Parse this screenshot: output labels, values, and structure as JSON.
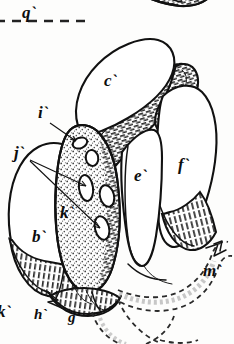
{
  "figure": {
    "background_color": "#fdfdfc",
    "ink_color": "#111111",
    "width": 234,
    "height": 344
  },
  "top_rule": {
    "label": "q`",
    "style": "dashed",
    "description": "horizontal dashed section line at top left"
  },
  "labels": [
    {
      "id": "q",
      "text": "q`",
      "x": 22,
      "y": 18,
      "has_leader": false,
      "note": "top-left section marker beside dashed rule"
    },
    {
      "id": "c",
      "text": "c`",
      "x": 110,
      "y": 85,
      "has_leader": false,
      "note": "upper lobe"
    },
    {
      "id": "i",
      "text": "i`",
      "x": 42,
      "y": 117,
      "has_leader": true,
      "note": "small upper pore"
    },
    {
      "id": "j",
      "text": "j`",
      "x": 16,
      "y": 155,
      "has_leader": true,
      "note": "two leaders to oval pores"
    },
    {
      "id": "e",
      "text": "e`",
      "x": 138,
      "y": 179,
      "has_leader": false,
      "note": "middle wedge lobe"
    },
    {
      "id": "f",
      "text": "f`",
      "x": 182,
      "y": 168,
      "has_leader": false,
      "note": "right lobe"
    },
    {
      "id": "k",
      "text": "k`",
      "x": 63,
      "y": 216,
      "has_leader": false,
      "note": "stippled column"
    },
    {
      "id": "b",
      "text": "b`",
      "x": 36,
      "y": 240,
      "has_leader": false,
      "note": "left lobe"
    },
    {
      "id": "m",
      "text": "m`",
      "x": 207,
      "y": 274,
      "has_leader": false,
      "note": "right dashed tube"
    },
    {
      "id": "kk",
      "text": "k`",
      "x": 2,
      "y": 315,
      "has_leader": false,
      "note": "lower-left marker, partly cropped"
    },
    {
      "id": "h",
      "text": "h`",
      "x": 38,
      "y": 317,
      "has_leader": false,
      "note": "lower base structure"
    },
    {
      "id": "g",
      "text": "g`",
      "x": 72,
      "y": 320,
      "has_leader": false,
      "note": "lower base structure"
    }
  ],
  "regions": [
    {
      "name": "upper-lobe-c",
      "label": "c`",
      "fill": "plain",
      "description": "large rounded lobe at upper centre"
    },
    {
      "name": "left-lobe-b",
      "label": "b`",
      "fill": "plain",
      "description": "large rounded lobe at left with hatched basal band"
    },
    {
      "name": "middle-wedge-e",
      "label": "e`",
      "fill": "plain",
      "description": "narrow wedge lobe at centre right"
    },
    {
      "name": "right-lobe-f",
      "label": "f`",
      "fill": "plain",
      "description": "large lobe at right with hatched basal band"
    },
    {
      "name": "central-column-k",
      "label": "k`",
      "fill": "stipple",
      "description": "stippled central column bearing oval pores"
    },
    {
      "name": "hatched-band-upper",
      "label": "",
      "fill": "hatch",
      "description": "hatched diagonal band running from upper-left to upper-right"
    },
    {
      "name": "basal-tube-m",
      "label": "m`",
      "fill": "dashed-outline",
      "description": "dashed-outline tube curving to the right and below"
    },
    {
      "name": "base-g-h",
      "label": "g`/h`",
      "fill": "hatch",
      "description": "hatched basal knot at the bottom"
    },
    {
      "name": "top-cropped-organ",
      "label": "",
      "fill": "hatch",
      "description": "cropped hatched oval structure at the top edge"
    }
  ],
  "pores": [
    {
      "name": "pore-i",
      "cx": 80,
      "cy": 143,
      "rx": 7,
      "ry": 5,
      "rot": -22
    },
    {
      "name": "pore-1",
      "cx": 92,
      "cy": 158,
      "rx": 6,
      "ry": 8,
      "rot": -10
    },
    {
      "name": "pore-2",
      "cx": 86,
      "cy": 188,
      "rx": 7,
      "ry": 13,
      "rot": -8
    },
    {
      "name": "pore-3",
      "cx": 107,
      "cy": 196,
      "rx": 7,
      "ry": 11,
      "rot": -12
    },
    {
      "name": "pore-4",
      "cx": 102,
      "cy": 228,
      "rx": 7,
      "ry": 12,
      "rot": -14
    }
  ]
}
